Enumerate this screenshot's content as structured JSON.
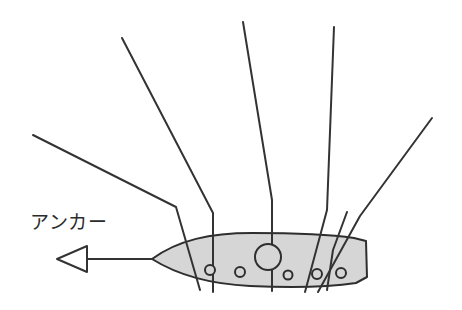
{
  "figure": {
    "name": "anchor-hull-diagram",
    "width": 462,
    "height": 310,
    "background_color": "#ffffff"
  },
  "labels": {
    "anchor": "アンカー"
  },
  "colors": {
    "stroke": "#333333",
    "hull_fill": "#d6d6d6",
    "hull_stroke": "#2e2e2e",
    "text": "#2b2b2b",
    "background": "#ffffff"
  },
  "chart_data": {
    "type": "diagram",
    "title": "アンカー",
    "hull": {
      "name": "hull-body",
      "fill": "#d6d6d6",
      "stroke": "#2e2e2e",
      "stroke_width": 2,
      "nose_tip": [
        152,
        259
      ],
      "stern_right_edge_x": 367,
      "top_y": 233,
      "bottom_y": 285
    },
    "holes": [
      {
        "name": "center-port",
        "cx": 268,
        "cy": 257,
        "r": 13
      },
      {
        "name": "small-port-1",
        "cx": 210,
        "cy": 270,
        "r": 5
      },
      {
        "name": "small-port-2",
        "cx": 240,
        "cy": 272,
        "r": 5
      },
      {
        "name": "small-port-3",
        "cx": 288,
        "cy": 275,
        "r": 4.5
      },
      {
        "name": "small-port-4",
        "cx": 317,
        "cy": 274,
        "r": 5
      },
      {
        "name": "small-port-5",
        "cx": 341,
        "cy": 273,
        "r": 5
      }
    ],
    "lines": [
      {
        "name": "rode-line-1",
        "points": [
          [
            33,
            135
          ],
          [
            176,
            207
          ],
          [
            200,
            290
          ]
        ]
      },
      {
        "name": "rode-line-2",
        "points": [
          [
            122,
            38
          ],
          [
            213,
            213
          ],
          [
            213,
            292
          ]
        ]
      },
      {
        "name": "rode-line-3",
        "points": [
          [
            243,
            22
          ],
          [
            272,
            200
          ],
          [
            272,
            291
          ]
        ]
      },
      {
        "name": "rode-line-4",
        "points": [
          [
            334,
            27
          ],
          [
            327,
            210
          ],
          [
            305,
            292
          ]
        ]
      },
      {
        "name": "rode-line-5",
        "points": [
          [
            432,
            118
          ],
          [
            360,
            216
          ],
          [
            318,
            292
          ]
        ]
      },
      {
        "name": "rode-line-6",
        "points": [
          [
            347,
            212
          ],
          [
            333,
            250
          ],
          [
            327,
            290
          ]
        ]
      }
    ],
    "arrow": {
      "name": "anchor-direction-arrow",
      "direction": "left",
      "style": "hollow-triangle",
      "tip": [
        57,
        259
      ],
      "tail": [
        152,
        259
      ],
      "head_back_x": 86,
      "head_half_height": 13
    },
    "legend": null,
    "grid": false
  }
}
